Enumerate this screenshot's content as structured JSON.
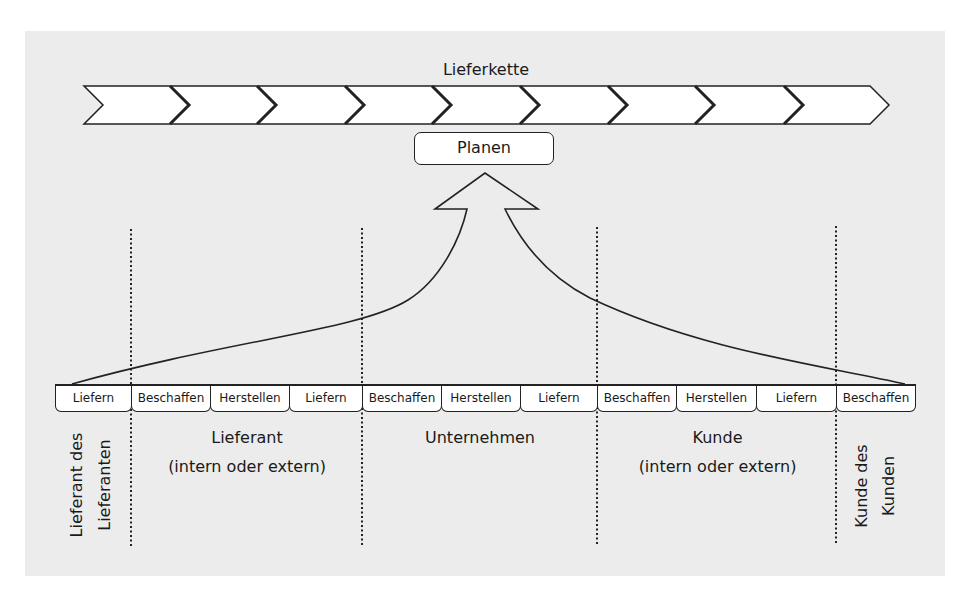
{
  "diagram": {
    "title": "Lieferkette",
    "chevron_count": 9,
    "plan_label": "Planen",
    "process_boxes": [
      {
        "label": "Liefern",
        "x": 55,
        "w": 76
      },
      {
        "label": "Beschaffen",
        "x": 131,
        "w": 79
      },
      {
        "label": "Herstellen",
        "x": 210,
        "w": 79
      },
      {
        "label": "Liefern",
        "x": 289,
        "w": 73
      },
      {
        "label": "Beschaffen",
        "x": 362,
        "w": 79
      },
      {
        "label": "Herstellen",
        "x": 441,
        "w": 79
      },
      {
        "label": "Liefern",
        "x": 520,
        "w": 77
      },
      {
        "label": "Beschaffen",
        "x": 597,
        "w": 79
      },
      {
        "label": "Herstellen",
        "x": 676,
        "w": 80
      },
      {
        "label": "Liefern",
        "x": 756,
        "w": 80
      },
      {
        "label": "Beschaffen",
        "x": 836,
        "w": 80
      }
    ],
    "sections": [
      {
        "id": "lieferant-des-lieferanten",
        "line1": "Lieferant des",
        "line2": "Lieferanten",
        "orientation": "vertical"
      },
      {
        "id": "lieferant",
        "line1": "Lieferant",
        "line2": "(intern oder extern)",
        "orientation": "horizontal"
      },
      {
        "id": "unternehmen",
        "line1": "Unternehmen",
        "line2": "",
        "orientation": "horizontal"
      },
      {
        "id": "kunde",
        "line1": "Kunde",
        "line2": "(intern oder extern)",
        "orientation": "horizontal"
      },
      {
        "id": "kunde-des-kunden",
        "line1": "Kunde des",
        "line2": "Kunden",
        "orientation": "vertical"
      }
    ],
    "divider_x": [
      131,
      362,
      597,
      836
    ],
    "colors": {
      "background": "#ececec",
      "stroke": "#222222",
      "fill": "#ffffff"
    }
  }
}
